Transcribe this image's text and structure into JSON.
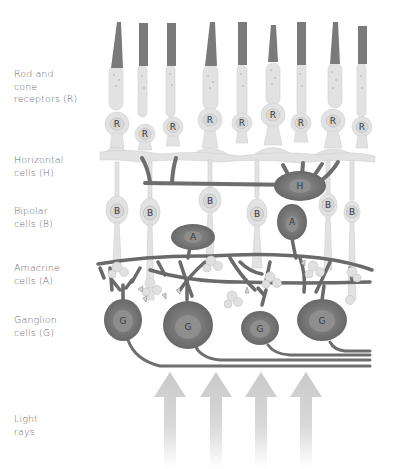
{
  "labels": {
    "receptors": "Rod and\ncone\nreceptors (R)",
    "horizontal": "Horizontal\ncells (H)",
    "bipolar": "Bipolar\ncells (B)",
    "amacrine": "Amacrine\ncells (A)",
    "ganglion": "Ganglion\ncells (G)",
    "light": "Light\nrays"
  },
  "cell_letters": {
    "receptor": "R",
    "horizontal": "H",
    "bipolar": "B",
    "amacrine": "A",
    "ganglion": "G"
  },
  "receptor_count": 9,
  "bipolar_count": 6,
  "amacrine_count": 2,
  "ganglion_count": 4,
  "horizontal_count": 1,
  "light_ray_arrow_count": 4,
  "colors": {
    "outer_segment": "#7a7a7a",
    "light_cell": "#e4e4e4",
    "dark_cell": "#6e6e6e",
    "label_text": "#6a6a6a",
    "arrow": "#cfcfcf"
  }
}
